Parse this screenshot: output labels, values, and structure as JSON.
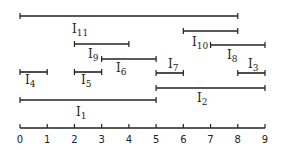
{
  "diagram": {
    "type": "interval-diagram",
    "axis": {
      "min": 0,
      "max": 9,
      "ticks": [
        "0",
        "1",
        "2",
        "3",
        "4",
        "5",
        "6",
        "7",
        "8",
        "9"
      ]
    },
    "intervals": [
      {
        "name": "I",
        "sub": "11",
        "start": 0,
        "end": 8,
        "y": 16,
        "label_x": 72,
        "label_y": 33
      },
      {
        "name": "I",
        "sub": "10",
        "start": 6,
        "end": 8,
        "y": 31,
        "label_x": 192,
        "label_y": 46
      },
      {
        "name": "I",
        "sub": "9",
        "start": 2,
        "end": 4,
        "y": 44,
        "label_x": 88,
        "label_y": 58
      },
      {
        "name": "I",
        "sub": "8",
        "start": 7,
        "end": 9,
        "y": 45,
        "label_x": 227,
        "label_y": 59
      },
      {
        "name": "I",
        "sub": "6",
        "start": 3,
        "end": 5,
        "y": 59,
        "label_x": 116,
        "label_y": 72
      },
      {
        "name": "I",
        "sub": "7",
        "start": 5,
        "end": 6,
        "y": 73,
        "label_x": 168,
        "label_y": 68
      },
      {
        "name": "I",
        "sub": "3",
        "start": 8,
        "end": 9,
        "y": 73,
        "label_x": 248,
        "label_y": 68
      },
      {
        "name": "I",
        "sub": "4",
        "start": 0,
        "end": 1,
        "y": 72,
        "label_x": 25,
        "label_y": 84
      },
      {
        "name": "I",
        "sub": "5",
        "start": 2,
        "end": 3,
        "y": 72,
        "label_x": 81,
        "label_y": 84
      },
      {
        "name": "I",
        "sub": "2",
        "start": 5,
        "end": 9,
        "y": 88,
        "label_x": 197,
        "label_y": 102
      },
      {
        "name": "I",
        "sub": "1",
        "start": 0,
        "end": 5,
        "y": 100,
        "label_x": 76,
        "label_y": 116
      }
    ],
    "colors": {
      "line": "#222222",
      "background": "#ffffff"
    }
  }
}
